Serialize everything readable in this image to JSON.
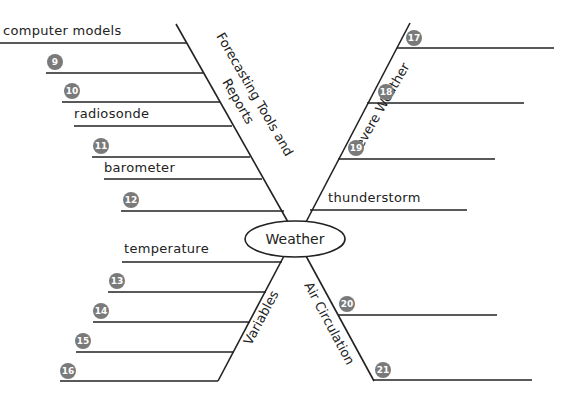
{
  "center": {
    "label": "Weather"
  },
  "branches": {
    "top_left": {
      "label_line1": "Forecasting Tools and",
      "label_line2": "Reports",
      "items": [
        {
          "type": "text",
          "text": "computer models"
        },
        {
          "type": "blank",
          "number": "9"
        },
        {
          "type": "blank",
          "number": "10"
        },
        {
          "type": "text",
          "text": "radiosonde"
        },
        {
          "type": "blank",
          "number": "11"
        },
        {
          "type": "text",
          "text": "barometer"
        },
        {
          "type": "blank",
          "number": "12"
        }
      ]
    },
    "top_right": {
      "label": "Severe Weather",
      "items": [
        {
          "type": "blank",
          "number": "17"
        },
        {
          "type": "blank",
          "number": "18"
        },
        {
          "type": "blank",
          "number": "19"
        },
        {
          "type": "text",
          "text": "thunderstorm"
        }
      ]
    },
    "bottom_left": {
      "label": "Variables",
      "items": [
        {
          "type": "text",
          "text": "temperature"
        },
        {
          "type": "blank",
          "number": "13"
        },
        {
          "type": "blank",
          "number": "14"
        },
        {
          "type": "blank",
          "number": "15"
        },
        {
          "type": "blank",
          "number": "16"
        }
      ]
    },
    "bottom_right": {
      "label": "Air Circulation",
      "items": [
        {
          "type": "blank",
          "number": "20"
        },
        {
          "type": "blank",
          "number": "21"
        }
      ]
    }
  },
  "colors": {
    "line": "#222222",
    "badge": "#7a7a7a",
    "badge_text": "#ffffff"
  }
}
